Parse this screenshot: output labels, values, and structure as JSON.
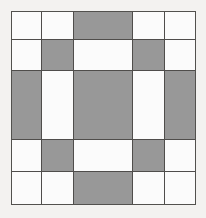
{
  "image": {
    "title": "Five-Patch Quilt Block",
    "description": "Symmetric five-by-five patchwork grid of gray and white squares",
    "width": 206,
    "height": 218,
    "background_color": "#f3f2f0"
  },
  "palette": {
    "gray": "#989898",
    "white": "#fbfbfb",
    "line": "#4f4d4b",
    "paper": "#f3f2f0"
  },
  "block": {
    "offset_x": 11,
    "offset_y": 11,
    "width": 185,
    "height": 194,
    "rows": 5,
    "columns": 5,
    "column_widths": [
      31,
      32,
      59,
      32,
      31
    ],
    "row_heights": [
      29,
      31,
      69,
      32,
      33
    ],
    "column_edges": [
      11,
      42,
      74,
      133,
      165,
      196
    ],
    "row_edges": [
      11,
      40,
      71,
      140,
      172,
      205
    ]
  },
  "chart_data": {
    "type": "heatmap",
    "xlabel": "",
    "ylabel": "",
    "categories": [
      "C1",
      "C2",
      "C3",
      "C4",
      "C5"
    ],
    "row_labels": [
      "R1",
      "R2",
      "R3",
      "R4",
      "R5"
    ],
    "legend": [
      {
        "label": "gray patch",
        "value": 1,
        "color": "#989898"
      },
      {
        "label": "white patch",
        "value": 0,
        "color": "#fbfbfb"
      }
    ],
    "grid": true,
    "values": [
      [
        0,
        0,
        1,
        0,
        0
      ],
      [
        0,
        1,
        0,
        1,
        0
      ],
      [
        1,
        0,
        1,
        0,
        1
      ],
      [
        0,
        1,
        0,
        1,
        0
      ],
      [
        0,
        0,
        1,
        0,
        0
      ]
    ],
    "gray_count": 9,
    "white_count": 16
  },
  "cells": [
    {
      "row": 0,
      "col": 0,
      "fill": "white"
    },
    {
      "row": 0,
      "col": 1,
      "fill": "white"
    },
    {
      "row": 0,
      "col": 2,
      "fill": "gray"
    },
    {
      "row": 0,
      "col": 3,
      "fill": "white"
    },
    {
      "row": 0,
      "col": 4,
      "fill": "white"
    },
    {
      "row": 1,
      "col": 0,
      "fill": "white"
    },
    {
      "row": 1,
      "col": 1,
      "fill": "gray"
    },
    {
      "row": 1,
      "col": 2,
      "fill": "white"
    },
    {
      "row": 1,
      "col": 3,
      "fill": "gray"
    },
    {
      "row": 1,
      "col": 4,
      "fill": "white"
    },
    {
      "row": 2,
      "col": 0,
      "fill": "gray"
    },
    {
      "row": 2,
      "col": 1,
      "fill": "white"
    },
    {
      "row": 2,
      "col": 2,
      "fill": "gray"
    },
    {
      "row": 2,
      "col": 3,
      "fill": "white"
    },
    {
      "row": 2,
      "col": 4,
      "fill": "gray"
    },
    {
      "row": 3,
      "col": 0,
      "fill": "white"
    },
    {
      "row": 3,
      "col": 1,
      "fill": "gray"
    },
    {
      "row": 3,
      "col": 2,
      "fill": "white"
    },
    {
      "row": 3,
      "col": 3,
      "fill": "gray"
    },
    {
      "row": 3,
      "col": 4,
      "fill": "white"
    },
    {
      "row": 4,
      "col": 0,
      "fill": "white"
    },
    {
      "row": 4,
      "col": 1,
      "fill": "white"
    },
    {
      "row": 4,
      "col": 2,
      "fill": "gray"
    },
    {
      "row": 4,
      "col": 3,
      "fill": "white"
    },
    {
      "row": 4,
      "col": 4,
      "fill": "white"
    }
  ]
}
